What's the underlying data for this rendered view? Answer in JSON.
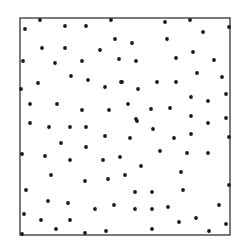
{
  "chart_data": {
    "type": "scatter",
    "title": "",
    "xlabel": "",
    "ylabel": "",
    "grid": false,
    "legend": null,
    "frame": {
      "left": 20,
      "top": 18,
      "right": 230,
      "bottom": 235,
      "stroke": "#333333"
    },
    "marker": {
      "color": "#1a1a1a",
      "radius": 1.9
    },
    "points": [
      [
        40,
        20
      ],
      [
        25,
        29
      ],
      [
        65,
        26
      ],
      [
        86,
        26
      ],
      [
        111,
        20
      ],
      [
        115,
        39
      ],
      [
        42,
        48
      ],
      [
        65,
        48
      ],
      [
        100,
        50
      ],
      [
        23,
        61
      ],
      [
        55,
        63
      ],
      [
        82,
        61
      ],
      [
        119,
        59
      ],
      [
        71,
        76
      ],
      [
        88,
        80
      ],
      [
        38,
        83
      ],
      [
        105,
        87
      ],
      [
        121,
        82
      ],
      [
        21,
        89
      ],
      [
        30,
        104
      ],
      [
        57,
        104
      ],
      [
        82,
        110
      ],
      [
        109,
        110
      ],
      [
        165,
        22
      ],
      [
        190,
        20
      ],
      [
        229,
        27
      ],
      [
        203,
        32
      ],
      [
        167,
        39
      ],
      [
        132,
        43
      ],
      [
        193,
        52
      ],
      [
        136,
        61
      ],
      [
        176,
        58
      ],
      [
        214,
        60
      ],
      [
        197,
        73
      ],
      [
        222,
        77
      ],
      [
        122,
        82
      ],
      [
        157,
        82
      ],
      [
        176,
        82
      ],
      [
        138,
        89
      ],
      [
        191,
        97
      ],
      [
        208,
        101
      ],
      [
        226,
        94
      ],
      [
        128,
        104
      ],
      [
        151,
        109
      ],
      [
        170,
        108
      ],
      [
        191,
        116
      ],
      [
        226,
        118
      ],
      [
        136,
        119
      ],
      [
        30,
        123
      ],
      [
        49,
        127
      ],
      [
        70,
        127
      ],
      [
        86,
        127
      ],
      [
        105,
        136
      ],
      [
        61,
        143
      ],
      [
        86,
        147
      ],
      [
        22,
        154
      ],
      [
        45,
        156
      ],
      [
        70,
        160
      ],
      [
        103,
        160
      ],
      [
        120,
        157
      ],
      [
        51,
        175
      ],
      [
        85,
        181
      ],
      [
        108,
        179
      ],
      [
        26,
        190
      ],
      [
        48,
        201
      ],
      [
        68,
        203
      ],
      [
        95,
        209
      ],
      [
        114,
        205
      ],
      [
        24,
        214
      ],
      [
        41,
        220
      ],
      [
        70,
        220
      ],
      [
        56,
        229
      ],
      [
        22,
        234
      ],
      [
        85,
        233
      ],
      [
        106,
        231
      ],
      [
        137,
        121
      ],
      [
        208,
        123
      ],
      [
        153,
        129
      ],
      [
        130,
        138
      ],
      [
        174,
        138
      ],
      [
        191,
        134
      ],
      [
        229,
        137
      ],
      [
        160,
        151
      ],
      [
        187,
        153
      ],
      [
        208,
        153
      ],
      [
        141,
        166
      ],
      [
        125,
        175
      ],
      [
        181,
        172
      ],
      [
        229,
        185
      ],
      [
        135,
        192
      ],
      [
        152,
        192
      ],
      [
        183,
        190
      ],
      [
        135,
        209
      ],
      [
        152,
        209
      ],
      [
        168,
        207
      ],
      [
        219,
        205
      ],
      [
        196,
        218
      ],
      [
        179,
        222
      ],
      [
        226,
        224
      ],
      [
        152,
        229
      ],
      [
        209,
        231
      ]
    ]
  }
}
